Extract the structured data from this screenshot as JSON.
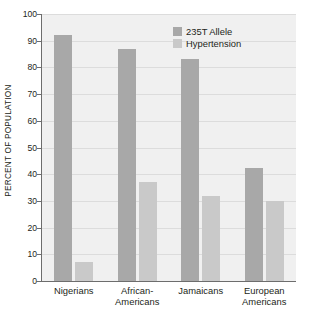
{
  "chart_data": {
    "type": "bar",
    "title": "",
    "xlabel": "",
    "ylabel": "PERCENT OF POPULATION",
    "ylim": [
      0,
      100
    ],
    "yticks": [
      0,
      10,
      20,
      30,
      40,
      50,
      60,
      70,
      80,
      90,
      100
    ],
    "ytick_labels": [
      "0",
      "10",
      "20",
      "30",
      "40",
      "50",
      "60",
      "70",
      "80",
      "90",
      "100"
    ],
    "grid": true,
    "legend_position": "top-right-inside",
    "categories": [
      "Nigerians",
      "African-\nAmericans",
      "Jamaicans",
      "European\nAmericans"
    ],
    "category_lines": [
      [
        "Nigerians"
      ],
      [
        "African-",
        "Americans"
      ],
      [
        "Jamaicans"
      ],
      [
        "European",
        "Americans"
      ]
    ],
    "series": [
      {
        "name": "235T Allele",
        "color": "#a8a8a8",
        "values": [
          92,
          87,
          83,
          42.5
        ]
      },
      {
        "name": "Hypertension",
        "color": "#c9c9c9",
        "values": [
          7,
          37,
          32,
          30
        ]
      }
    ]
  },
  "legend": {
    "items": [
      {
        "label": "235T Allele",
        "color": "#a8a8a8"
      },
      {
        "label": "Hypertension",
        "color": "#c9c9c9"
      }
    ]
  },
  "colors": {
    "plot_background": "#f0f0f0",
    "gridline": "#dcdcdc",
    "axis": "#6d6d6d",
    "text": "#231f20",
    "page_background": "#ffffff"
  }
}
